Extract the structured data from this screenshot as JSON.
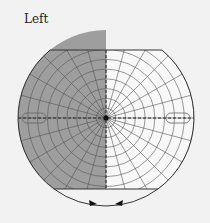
{
  "title": "Left",
  "chart_data": {
    "type": "polar-field-diagram",
    "title": "Left",
    "eye": "Left",
    "center": [
      106,
      118
    ],
    "outer_radius": 88,
    "ring_count": 9,
    "spoke_count": 24,
    "shaded_half": "left",
    "top_cut_y": 50,
    "bottom_cut_y": 189,
    "blind_spot_markers": [
      "left",
      "right"
    ],
    "bottom_arrows": 2
  },
  "colors": {
    "shade": "#9e9e9e",
    "grid": "#555555",
    "background": "#f2f2f2",
    "outline": "#333333"
  }
}
